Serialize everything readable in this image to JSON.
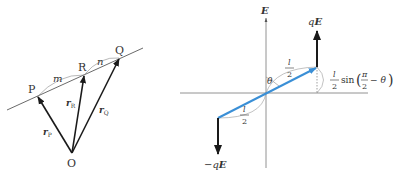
{
  "left_diagram": {
    "points": {
      "P": "P",
      "R": "R",
      "Q": "Q",
      "O": "O"
    },
    "segment_labels": {
      "m": "m",
      "n": "n"
    },
    "vectors": {
      "rP": {
        "base": "r",
        "sub": "P"
      },
      "rR": {
        "base": "r",
        "sub": "R"
      },
      "rQ": {
        "base": "r",
        "sub": "Q"
      }
    }
  },
  "right_diagram": {
    "axis_label": "E",
    "force_top": {
      "q": "q",
      "E": "E"
    },
    "force_bottom": {
      "minus_q": "−q",
      "E": "E"
    },
    "angle": "θ",
    "half_length_top": {
      "num": "l",
      "den": "2"
    },
    "half_length_bottom": {
      "num": "l",
      "den": "2"
    },
    "projection": {
      "num": "l",
      "den": "2",
      "func": "sin",
      "inner_num": "π",
      "inner_den": "2",
      "minus_theta": "− θ"
    },
    "colors": {
      "dipole": "#3a8fd6",
      "arrow": "#1a1a1a",
      "axis": "#777777"
    }
  }
}
